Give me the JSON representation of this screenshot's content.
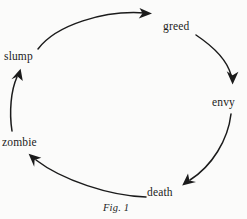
{
  "figure": {
    "caption": "Fig. 1",
    "background_color": "#fbfbfa",
    "ink_color": "#1b1b1b",
    "nodes": [
      {
        "id": "greed",
        "label": "greed",
        "x": 178,
        "y": 27
      },
      {
        "id": "envy",
        "label": "envy",
        "x": 225,
        "y": 102
      },
      {
        "id": "death",
        "label": "death",
        "x": 163,
        "y": 192
      },
      {
        "id": "zombie",
        "label": "zombie",
        "x": 20,
        "y": 142
      },
      {
        "id": "slump",
        "label": "slump",
        "x": 22,
        "y": 57
      }
    ],
    "edges": [
      {
        "id": "slump-to-greed",
        "from": "slump",
        "to": "greed",
        "arrowhead": "right"
      },
      {
        "id": "greed-to-envy",
        "from": "greed",
        "to": "envy",
        "arrowhead": "down"
      },
      {
        "id": "envy-to-death",
        "from": "envy",
        "to": "death",
        "arrowhead": "down-left"
      },
      {
        "id": "death-to-zombie",
        "from": "death",
        "to": "zombie",
        "arrowhead": "up-left"
      },
      {
        "id": "zombie-to-slump",
        "from": "zombie",
        "to": "slump",
        "arrowhead": "up"
      }
    ]
  }
}
